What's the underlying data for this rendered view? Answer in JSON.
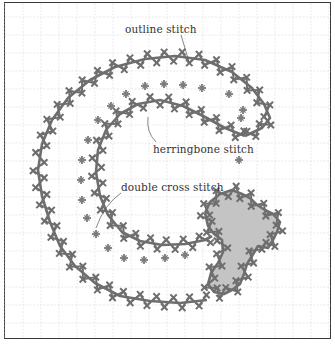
{
  "diagram": {
    "type": "embroidery stitch illustration",
    "colors": {
      "background": "#ffffff",
      "frame": "#3a3a3a",
      "grid": "#dcdcdc",
      "stitch": "#6e6e6e",
      "cross": "#7a7a7a",
      "fill": "#c4c4c4",
      "leader": "#555555",
      "text": "#333333"
    },
    "grid_spacing": 18,
    "labels": [
      {
        "id": "outline",
        "text": "outline stitch",
        "x": 125,
        "y": 23
      },
      {
        "id": "herringbone",
        "text": "herringbone stitch",
        "x": 153,
        "y": 143
      },
      {
        "id": "double_cross",
        "text": "double cross stitch",
        "x": 121,
        "y": 181
      }
    ],
    "leaders": [
      {
        "for": "outline",
        "d": "M181,35 Q185,48 189,62"
      },
      {
        "for": "herringbone",
        "d": "M148,117 Q146,132 156,142"
      },
      {
        "for": "double_cross",
        "d": "M121,193 Q104,205 96,228"
      }
    ],
    "outer_path": [
      [
        207,
        300
      ],
      [
        180,
        303
      ],
      [
        150,
        301
      ],
      [
        120,
        296
      ],
      [
        95,
        283
      ],
      [
        75,
        266
      ],
      [
        60,
        246
      ],
      [
        50,
        222
      ],
      [
        42,
        196
      ],
      [
        38,
        170
      ],
      [
        42,
        144
      ],
      [
        52,
        120
      ],
      [
        68,
        98
      ],
      [
        90,
        80
      ],
      [
        115,
        67
      ],
      [
        145,
        59
      ],
      [
        175,
        56
      ],
      [
        205,
        60
      ],
      [
        232,
        72
      ],
      [
        252,
        88
      ],
      [
        264,
        104
      ],
      [
        270,
        118
      ],
      [
        262,
        128
      ],
      [
        245,
        136
      ]
    ],
    "inner_path": [
      [
        245,
        136
      ],
      [
        225,
        128
      ],
      [
        205,
        117
      ],
      [
        183,
        106
      ],
      [
        160,
        100
      ],
      [
        138,
        104
      ],
      [
        120,
        114
      ],
      [
        106,
        130
      ],
      [
        98,
        150
      ],
      [
        96,
        172
      ],
      [
        100,
        196
      ],
      [
        108,
        215
      ],
      [
        122,
        232
      ],
      [
        140,
        241
      ],
      [
        162,
        245
      ],
      [
        185,
        244
      ],
      [
        205,
        240
      ],
      [
        212,
        236
      ]
    ],
    "crosses": [
      [
        145,
        86
      ],
      [
        164,
        84
      ],
      [
        183,
        85
      ],
      [
        202,
        88
      ],
      [
        126,
        94
      ],
      [
        111,
        106
      ],
      [
        229,
        94
      ],
      [
        243,
        110
      ],
      [
        98,
        120
      ],
      [
        88,
        140
      ],
      [
        82,
        160
      ],
      [
        81,
        180
      ],
      [
        82,
        200
      ],
      [
        87,
        218
      ],
      [
        96,
        234
      ],
      [
        108,
        248
      ],
      [
        124,
        258
      ],
      [
        144,
        260
      ],
      [
        165,
        258
      ],
      [
        185,
        255
      ],
      [
        241,
        118
      ],
      [
        239,
        160
      ]
    ],
    "blob": [
      [
        205,
        213
      ],
      [
        210,
        202
      ],
      [
        220,
        194
      ],
      [
        232,
        190
      ],
      [
        242,
        194
      ],
      [
        250,
        198
      ],
      [
        257,
        205
      ],
      [
        265,
        210
      ],
      [
        273,
        214
      ],
      [
        280,
        222
      ],
      [
        277,
        232
      ],
      [
        273,
        240
      ],
      [
        268,
        248
      ],
      [
        258,
        246
      ],
      [
        252,
        256
      ],
      [
        247,
        264
      ],
      [
        244,
        274
      ],
      [
        240,
        284
      ],
      [
        232,
        290
      ],
      [
        224,
        294
      ],
      [
        214,
        292
      ],
      [
        208,
        284
      ],
      [
        211,
        273
      ],
      [
        218,
        263
      ],
      [
        223,
        252
      ],
      [
        222,
        240
      ],
      [
        214,
        234
      ],
      [
        208,
        226
      ]
    ]
  }
}
